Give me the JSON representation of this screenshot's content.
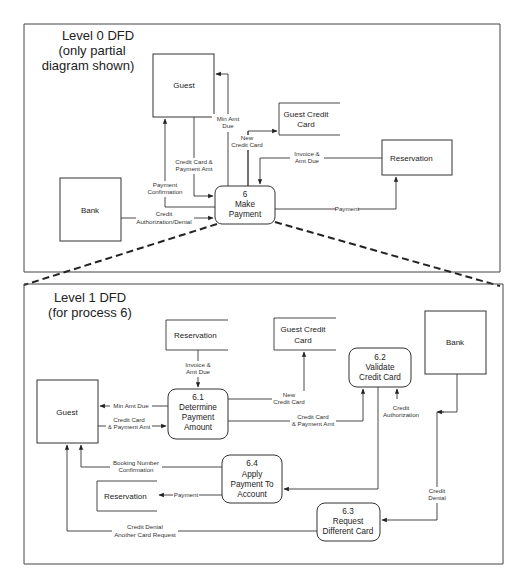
{
  "level0": {
    "title_lines": [
      "Level 0 DFD",
      "(only partial",
      "diagram shown)"
    ],
    "entities": {
      "guest": "Guest",
      "bank": "Bank",
      "reservation": "Reservation"
    },
    "stores": {
      "guest_credit_card": [
        "Guest Credit",
        "Card"
      ]
    },
    "process": {
      "number": "6",
      "name_lines": [
        "Make",
        "Payment"
      ]
    },
    "flows": {
      "min_amt_due": [
        "Min Amt",
        "Due"
      ],
      "new_credit_card": [
        "New",
        "Credit Card"
      ],
      "invoice_amt_due": [
        "Invoice &",
        "Amt Due"
      ],
      "credit_card_payment_amt": [
        "Credit Card &",
        "Payment Amt"
      ],
      "payment_confirmation": [
        "Payment",
        "Confirmation"
      ],
      "credit_auth_denial": [
        "Credit",
        "Authorization/Denial"
      ],
      "payment": "Payment"
    }
  },
  "level1": {
    "title_lines": [
      "Level 1 DFD",
      "(for process 6)"
    ],
    "entities": {
      "guest": "Guest",
      "bank": "Bank"
    },
    "stores": {
      "reservation_top": "Reservation",
      "guest_credit_card": [
        "Guest Credit",
        "Card"
      ],
      "reservation_bottom": "Reservation"
    },
    "processes": [
      {
        "number": "6.1",
        "name_lines": [
          "Determine",
          "Payment",
          "Amount"
        ]
      },
      {
        "number": "6.2",
        "name_lines": [
          "Validate",
          "Credit Card"
        ]
      },
      {
        "number": "6.3",
        "name_lines": [
          "Request",
          "Different Card"
        ]
      },
      {
        "number": "6.4",
        "name_lines": [
          "Apply",
          "Payment To",
          "Account"
        ]
      }
    ],
    "flows": {
      "invoice_amt_due": [
        "Invoice &",
        "Amt Due"
      ],
      "min_amt_due": "Min Amt Due",
      "credit_card_payment_amt_to_61": [
        "Credit Card",
        "& Payment Amt"
      ],
      "new_credit_card": [
        "New",
        "Credit Card"
      ],
      "credit_card_payment_amt_to_62": [
        "Credit Card",
        "& Payment Amt"
      ],
      "credit_authorization": [
        "Credit",
        "Authorization"
      ],
      "booking_confirmation": [
        "Booking Number",
        "Confirmation"
      ],
      "payment": "Payment",
      "credit_denial": [
        "Credit",
        "Denial"
      ],
      "credit_denial_another": [
        "Credit Denial",
        "Another Card Request"
      ]
    }
  }
}
